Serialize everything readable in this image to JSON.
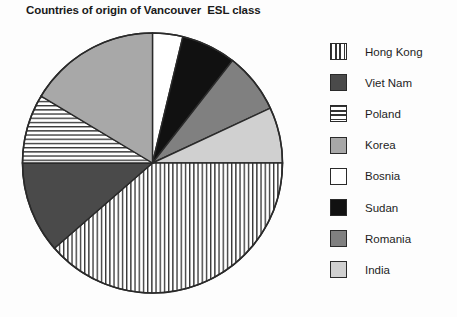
{
  "chart_data": {
    "type": "pie",
    "title": "Countries of origin of Vancouver  ESL class",
    "xlabel": "",
    "ylabel": "",
    "legend_position": "right",
    "grid": false,
    "categories": [
      "Hong Kong",
      "Viet Nam",
      "Poland",
      "Korea",
      "Bosnia",
      "Sudan",
      "Romania",
      "India"
    ],
    "values": [
      38.6,
      11.4,
      8.6,
      16.4,
      3.8,
      6.8,
      7.5,
      6.9
    ],
    "value_unit": "percent",
    "slices": [
      {
        "label": "Bosnia",
        "percent": 3.8,
        "start_angle_deg": 0,
        "end_angle_deg": 13.5,
        "fill": "#ffffff",
        "pattern": "solid"
      },
      {
        "label": "Sudan",
        "percent": 6.8,
        "start_angle_deg": 13.5,
        "end_angle_deg": 38,
        "fill": "#111111",
        "pattern": "solid"
      },
      {
        "label": "Romania",
        "percent": 7.5,
        "start_angle_deg": 38,
        "end_angle_deg": 65,
        "fill": "#808080",
        "pattern": "solid"
      },
      {
        "label": "India",
        "percent": 6.9,
        "start_angle_deg": 65,
        "end_angle_deg": 90,
        "fill": "#d0d0d0",
        "pattern": "solid"
      },
      {
        "label": "Hong Kong",
        "percent": 38.6,
        "start_angle_deg": 90,
        "end_angle_deg": 229,
        "fill": "#ffffff",
        "pattern": "vertical-lines"
      },
      {
        "label": "Viet Nam",
        "percent": 11.4,
        "start_angle_deg": 229,
        "end_angle_deg": 270,
        "fill": "#4a4a4a",
        "pattern": "solid"
      },
      {
        "label": "Poland",
        "percent": 8.6,
        "start_angle_deg": 270,
        "end_angle_deg": 301,
        "fill": "#ffffff",
        "pattern": "horizontal-lines"
      },
      {
        "label": "Korea",
        "percent": 16.4,
        "start_angle_deg": 301,
        "end_angle_deg": 360,
        "fill": "#a8a8a8",
        "pattern": "solid"
      }
    ]
  },
  "title": "Countries of origin of Vancouver  ESL class",
  "legend": {
    "items": [
      {
        "label": "Hong Kong",
        "pattern": "vertical-lines",
        "fill": "#ffffff"
      },
      {
        "label": "Viet Nam",
        "pattern": "solid",
        "fill": "#4a4a4a"
      },
      {
        "label": "Poland",
        "pattern": "horizontal-lines",
        "fill": "#ffffff"
      },
      {
        "label": "Korea",
        "pattern": "solid",
        "fill": "#a8a8a8"
      },
      {
        "label": "Bosnia",
        "pattern": "solid",
        "fill": "#ffffff"
      },
      {
        "label": "Sudan",
        "pattern": "solid",
        "fill": "#111111"
      },
      {
        "label": "Romania",
        "pattern": "solid",
        "fill": "#808080"
      },
      {
        "label": "India",
        "pattern": "solid",
        "fill": "#d0d0d0"
      }
    ]
  },
  "geometry": {
    "center_x": 152.5,
    "center_y": 163,
    "radius": 130
  },
  "colors": {
    "stroke": "#2a2a2a",
    "background": "#fdfdfd",
    "text": "#1d1d1d"
  }
}
